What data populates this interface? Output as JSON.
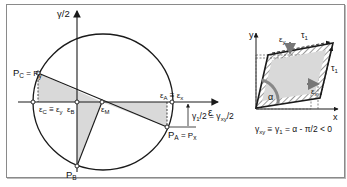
{
  "figure": {
    "left_panel": {
      "title": "Mohr's circle for strain",
      "axes": {
        "vertical_label": "γ/2",
        "horizontal_label": "ε"
      },
      "points": {
        "PC_Py": "P",
        "PC_sub": "C",
        "PC_eq": " = P",
        "Py_sub": "y",
        "PA_label": "P",
        "PA_sub": "A",
        "PA_eq": " = P",
        "Px_sub": "x",
        "PB_label": "P",
        "PB_sub": "B"
      },
      "axis_points": {
        "epsC": "ε",
        "epsC_sub": "C",
        "epsC_eq": " ≡ ε",
        "epsY_sub": "y",
        "epsB": "ε",
        "epsB_sub": "B",
        "epsM": "ε",
        "epsM_sub": "M",
        "epsA": "ε",
        "epsA_sub": "A",
        "epsA_eq": " ≡ ε",
        "epsX_sub": "x"
      },
      "dimension": {
        "gamma1_half": "γ",
        "gamma1_sub": "1",
        "gamma1_rest": "/2 = γ",
        "gammaXY_sub": "xy",
        "gammaXY_rest": "/2"
      }
    },
    "right_panel": {
      "axis_y": "y",
      "axis_x": "x",
      "eps_y": "ε",
      "eps_y_sub": "y",
      "eps_x": "ε",
      "eps_x_sub": "x",
      "tau_top": "τ",
      "tau_top_sub": "1",
      "tau_right": "τ",
      "tau_right_sub": "1",
      "alpha": "α",
      "formula": {
        "g": "γ",
        "g_sub": "xy",
        "eq1": " ≡ γ",
        "g1_sub": "1",
        "rest": " = α - π/2 < 0"
      }
    },
    "colors": {
      "line": "#1a1a1a",
      "shade": "#d9d9d9",
      "arrow_gray": "#777777",
      "frame": "#8a8a8a"
    }
  }
}
